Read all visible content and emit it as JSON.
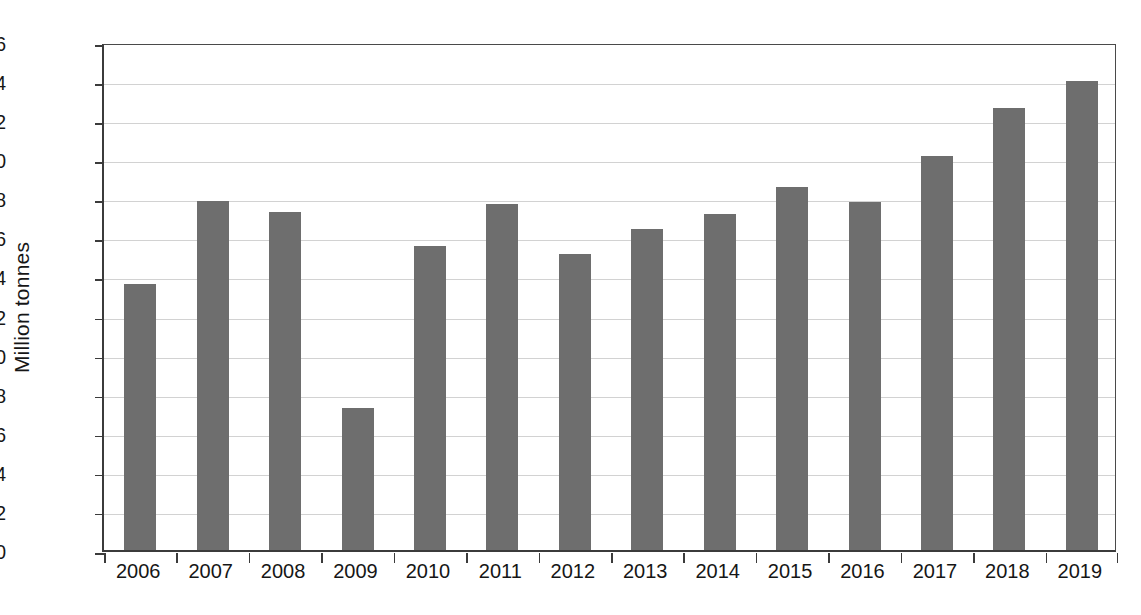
{
  "chart_data": {
    "type": "bar",
    "title": "",
    "subtitle": "",
    "xlabel": "",
    "ylabel": "Million tonnes",
    "categories": [
      "2006",
      "2007",
      "2008",
      "2009",
      "2010",
      "2011",
      "2012",
      "2013",
      "2014",
      "2015",
      "2016",
      "2017",
      "2018",
      "2019"
    ],
    "values": [
      13.6,
      17.85,
      17.3,
      7.25,
      15.55,
      17.7,
      15.15,
      16.45,
      17.2,
      18.6,
      17.8,
      20.15,
      22.6,
      24.0
    ],
    "ylim": [
      0,
      26
    ],
    "ytick_step": 2,
    "yticks": [
      "0",
      "2",
      "4",
      "6",
      "8",
      "10",
      "12",
      "14",
      "16",
      "18",
      "20",
      "22",
      "24",
      "26"
    ],
    "grid": true,
    "grid_axis": "y",
    "legend": false,
    "legend_position": "none",
    "bar_color": "#6e6e6e",
    "grid_color": "#d2d2d2",
    "axis_color": "#3b3b3b",
    "background_color": "#ffffff",
    "text_color": "#161616"
  }
}
